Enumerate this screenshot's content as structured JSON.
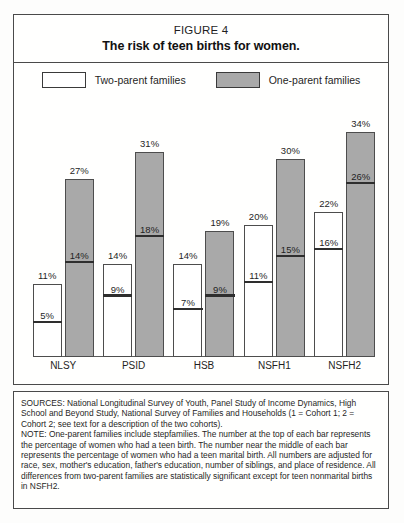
{
  "figure": {
    "number_label": "FIGURE 4",
    "title": "The risk of teen births for women."
  },
  "legend": {
    "items": [
      {
        "label": "Two-parent families",
        "color": "#ffffff",
        "key": "two-parent"
      },
      {
        "label": "One-parent families",
        "color": "#a9a9a9",
        "key": "one-parent"
      }
    ]
  },
  "notes": {
    "sources": "SOURCES: National Longitudinal Survey of Youth, Panel Study of Income Dynamics, High School and Beyond Study, National Survey of Families and Households (1 = Cohort 1; 2 = Cohort 2; see text for a description of the two cohorts).",
    "note": "NOTE: One-parent families include stepfamilies. The number at the top of each bar represents the percentage of women who had a teen birth. The number near the middle of each bar represents the percentage of women who had a teen marital birth. All numbers are adjusted for race, sex, mother's education, father's education, number of siblings, and place of residence. All differences from two-parent families are statistically significant except for teen nonmarital births in NSFH2."
  },
  "chart_data": {
    "type": "bar",
    "title": "The risk of teen births for women.",
    "xlabel": "",
    "ylabel": "",
    "ylim": [
      0,
      36
    ],
    "grid": false,
    "legend_position": "top-center",
    "categories": [
      "NLSY",
      "PSID",
      "HSB",
      "NSFH1",
      "NSFH2"
    ],
    "series": [
      {
        "name": "Two-parent families",
        "color": "#ffffff",
        "values": [
          11,
          14,
          14,
          20,
          22
        ],
        "value_labels": [
          "11%",
          "14%",
          "14%",
          "20%",
          "22%"
        ],
        "inner_values": [
          5,
          9,
          7,
          11,
          16
        ],
        "inner_labels": [
          "5%",
          "9%",
          "7%",
          "11%",
          "16%"
        ]
      },
      {
        "name": "One-parent families",
        "color": "#a9a9a9",
        "values": [
          27,
          31,
          19,
          30,
          34
        ],
        "value_labels": [
          "27%",
          "31%",
          "19%",
          "30%",
          "34%"
        ],
        "inner_values": [
          14,
          18,
          9,
          15,
          26
        ],
        "inner_labels": [
          "14%",
          "18%",
          "9%",
          "15%",
          "26%"
        ]
      }
    ],
    "annotations": {
      "top_number_meaning": "percentage of women who had a teen birth",
      "inner_number_meaning": "percentage of women who had a teen marital birth"
    }
  }
}
